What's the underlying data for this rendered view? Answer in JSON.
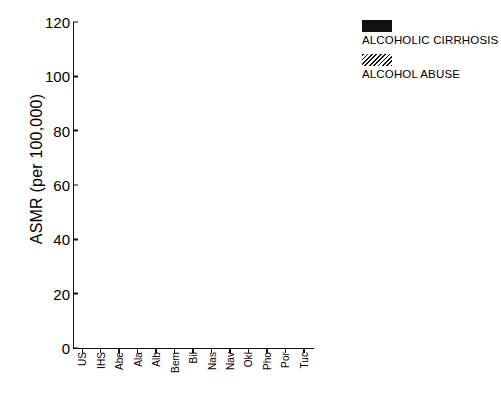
{
  "chart_data": {
    "type": "bar",
    "stacked": true,
    "title": "",
    "xlabel": "",
    "ylabel": "ASMR (per 100,000)",
    "ylim": [
      0,
      120
    ],
    "yticks": [
      0,
      20,
      40,
      60,
      80,
      100,
      120
    ],
    "grid": false,
    "legend_position": "top-right",
    "categories": [
      "US",
      "IHS",
      "Abe",
      "Ala",
      "Alb",
      "Bem",
      "Bil",
      "Nas",
      "Nav",
      "Okl",
      "Pho",
      "Por",
      "Tuc"
    ],
    "series": [
      {
        "name": "ALCOHOL ABUSE",
        "fill": "hatched",
        "values": [
          1.5,
          16.0,
          16.0,
          13.0,
          31.0,
          5.0,
          28.0,
          7.0,
          14.0,
          8.0,
          34.0,
          13.5,
          17.5
        ]
      },
      {
        "name": "ALCOHOLIC CIRRHOSIS",
        "fill": "solid",
        "values": [
          5.0,
          23.0,
          51.0,
          8.0,
          32.0,
          13.5,
          83.0,
          5.0,
          13.5,
          15.0,
          51.5,
          41.0,
          52.0
        ]
      }
    ],
    "totals": [
      6.5,
      39.0,
      67.0,
      21.0,
      63.0,
      18.5,
      111.0,
      12.0,
      27.5,
      23.0,
      85.5,
      54.5,
      69.5
    ]
  },
  "axis": {
    "y_title": "ASMR (per 100,000)",
    "y_ticks": [
      "120",
      "100",
      "80",
      "60",
      "40",
      "20",
      "0"
    ],
    "x_ticks": [
      "US",
      "IHS",
      "Abe",
      "Ala",
      "Alb",
      "Bem",
      "Bil",
      "Nas",
      "Nav",
      "Okl",
      "Pho",
      "Por",
      "Tuc"
    ]
  },
  "legend": {
    "entries": [
      {
        "label": "ALCOHOLIC CIRRHOSIS",
        "swatch": "solid-black"
      },
      {
        "label": "ALCOHOL ABUSE",
        "swatch": "hatched-diagonal"
      }
    ]
  },
  "caption": {
    "text": ""
  },
  "colors": {
    "ink": "#111111",
    "background": "#ffffff"
  }
}
